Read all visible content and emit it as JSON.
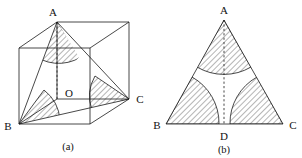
{
  "figure": {
    "background_color": "#ffffff",
    "line_color": "#1a1a1a",
    "hatch_color": "#3a3a3a",
    "panels": [
      {
        "id": "panel-a",
        "caption": "(a)",
        "description": "cube with inscribed triangle ABC and shaded vertex angle sectors",
        "vertex_labels": [
          "A",
          "O",
          "B",
          "C"
        ],
        "labels": {
          "apex": "A",
          "center": "O",
          "left": "B",
          "right": "C"
        }
      },
      {
        "id": "panel-b",
        "caption": "(b)",
        "description": "isosceles triangle ABC with altitude AD and shaded vertex angle sectors",
        "vertex_labels": [
          "A",
          "B",
          "D",
          "C"
        ],
        "labels": {
          "apex": "A",
          "left": "B",
          "foot": "D",
          "right": "C"
        }
      }
    ]
  }
}
